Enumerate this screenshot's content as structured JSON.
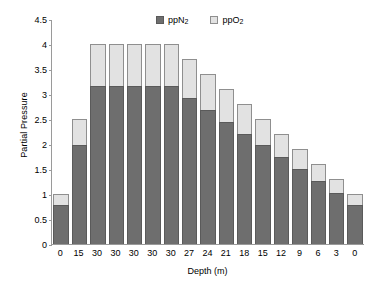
{
  "chart_data": {
    "type": "bar",
    "stacked": true,
    "title": "",
    "xlabel": "Depth (m)",
    "ylabel": "Partial Pressure",
    "categories": [
      "0",
      "15",
      "30",
      "30",
      "30",
      "30",
      "30",
      "27",
      "24",
      "21",
      "18",
      "15",
      "12",
      "9",
      "6",
      "3",
      "0"
    ],
    "series": [
      {
        "name": "ppN2",
        "display_name": "ppN",
        "subscript": "2",
        "color": "#6e6e6e",
        "values": [
          0.79,
          1.98,
          3.16,
          3.16,
          3.16,
          3.16,
          3.16,
          2.92,
          2.69,
          2.45,
          2.21,
          1.98,
          1.74,
          1.5,
          1.26,
          1.03,
          0.79
        ]
      },
      {
        "name": "ppO2",
        "display_name": "ppO",
        "subscript": "2",
        "color": "#e2e2e2",
        "values": [
          0.21,
          0.52,
          0.84,
          0.84,
          0.84,
          0.84,
          0.84,
          0.78,
          0.71,
          0.65,
          0.59,
          0.52,
          0.46,
          0.4,
          0.34,
          0.27,
          0.21
        ]
      }
    ],
    "totals": [
      1.0,
      2.5,
      4.0,
      4.0,
      4.0,
      4.0,
      4.0,
      3.7,
      3.4,
      3.1,
      2.8,
      2.5,
      2.2,
      1.9,
      1.6,
      1.3,
      1.0
    ],
    "ylim": [
      0,
      4.5
    ],
    "yticks": [
      "4.5",
      "4",
      "3.5",
      "3",
      "2.5",
      "2",
      "1.5",
      "1",
      "0.5",
      "0"
    ],
    "ytick_values": [
      4.5,
      4,
      3.5,
      3,
      2.5,
      2,
      1.5,
      1,
      0.5,
      0
    ],
    "grid": false,
    "legend_position": "top-center"
  },
  "legend": {
    "items": [
      {
        "label_main": "pp",
        "label_el": "N",
        "label_sub": "2",
        "swatch": "dark-square"
      },
      {
        "label_main": "pp",
        "label_el": "O",
        "label_sub": "2",
        "swatch": "light-square"
      }
    ]
  }
}
